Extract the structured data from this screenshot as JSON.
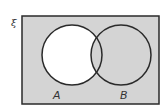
{
  "diagram": {
    "type": "venn",
    "universal_symbol": "ξ",
    "sets": [
      {
        "label": "A"
      },
      {
        "label": "B"
      }
    ],
    "shaded_region": "complement of (A only)",
    "unshaded_region": "A only",
    "colors": {
      "shade": "#d4d4d4",
      "unshaded": "#ffffff",
      "stroke": "#2a2a2a"
    }
  }
}
